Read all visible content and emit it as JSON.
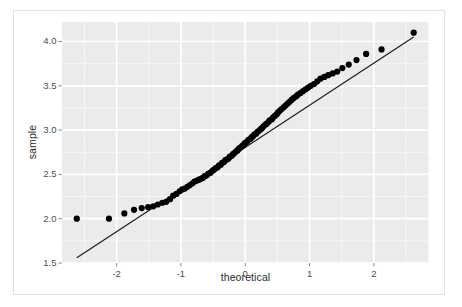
{
  "figure": {
    "background_color": "#ffffff",
    "border_color": "#e2e2e2",
    "panel_background_color": "#ebebeb",
    "gridline_major_color": "#ffffff",
    "gridline_minor_color": "#f7f7f7",
    "point_color": "#000000",
    "line_color": "#1a1a1a"
  },
  "chart_data": {
    "type": "scatter",
    "title": "",
    "subtitle": "",
    "xlabel": "theoretical",
    "ylabel": "sample",
    "xlim": [
      -2.85,
      2.85
    ],
    "ylim": [
      1.5,
      4.22
    ],
    "grid": true,
    "legend": "none",
    "x_ticks": [
      -2,
      -1,
      0,
      1,
      2
    ],
    "x_tick_labels": [
      "-2",
      "-1",
      "0",
      "1",
      "2"
    ],
    "y_ticks": [
      1.5,
      2.0,
      2.5,
      3.0,
      3.5,
      4.0
    ],
    "y_tick_labels": [
      "1.5",
      "2.0",
      "2.5",
      "3.0",
      "3.5",
      "4.0"
    ],
    "x_minor_ticks": [
      -2.5,
      -1.5,
      -0.5,
      0.5,
      1.5,
      2.5
    ],
    "y_minor_ticks": [
      1.75,
      2.25,
      2.75,
      3.25,
      3.75,
      4.25
    ],
    "reference_line": {
      "label": "qq-reference-line",
      "x_start": -2.62,
      "y_start": 1.56,
      "x_end": 2.62,
      "y_end": 4.05
    },
    "series": [
      {
        "name": "sample quantiles",
        "marker": "filled-circle",
        "marker_size": 3.1,
        "x": [
          -2.62,
          -2.12,
          -1.88,
          -1.73,
          -1.61,
          -1.51,
          -1.43,
          -1.36,
          -1.29,
          -1.23,
          -1.17,
          -1.12,
          -1.07,
          -1.02,
          -0.98,
          -0.94,
          -0.9,
          -0.86,
          -0.82,
          -0.79,
          -0.75,
          -0.72,
          -0.69,
          -0.66,
          -0.63,
          -0.6,
          -0.57,
          -0.54,
          -0.51,
          -0.49,
          -0.46,
          -0.43,
          -0.41,
          -0.38,
          -0.36,
          -0.33,
          -0.31,
          -0.28,
          -0.26,
          -0.24,
          -0.21,
          -0.19,
          -0.17,
          -0.14,
          -0.12,
          -0.1,
          -0.08,
          -0.05,
          -0.03,
          -0.01,
          0.01,
          0.03,
          0.05,
          0.08,
          0.1,
          0.12,
          0.14,
          0.17,
          0.19,
          0.21,
          0.24,
          0.26,
          0.28,
          0.31,
          0.33,
          0.36,
          0.38,
          0.41,
          0.43,
          0.46,
          0.49,
          0.51,
          0.54,
          0.57,
          0.6,
          0.63,
          0.66,
          0.69,
          0.72,
          0.75,
          0.79,
          0.82,
          0.86,
          0.9,
          0.94,
          0.98,
          1.02,
          1.07,
          1.12,
          1.17,
          1.23,
          1.29,
          1.36,
          1.43,
          1.51,
          1.61,
          1.73,
          1.88,
          2.12,
          2.62
        ],
        "y": [
          2.0,
          2.0,
          2.06,
          2.1,
          2.12,
          2.13,
          2.14,
          2.16,
          2.18,
          2.19,
          2.22,
          2.26,
          2.28,
          2.31,
          2.33,
          2.34,
          2.36,
          2.38,
          2.4,
          2.42,
          2.43,
          2.44,
          2.45,
          2.46,
          2.48,
          2.49,
          2.51,
          2.52,
          2.54,
          2.55,
          2.57,
          2.58,
          2.6,
          2.61,
          2.63,
          2.64,
          2.66,
          2.67,
          2.68,
          2.7,
          2.71,
          2.73,
          2.74,
          2.76,
          2.77,
          2.79,
          2.8,
          2.82,
          2.83,
          2.85,
          2.86,
          2.87,
          2.89,
          2.9,
          2.92,
          2.93,
          2.95,
          2.96,
          2.98,
          2.99,
          3.01,
          3.02,
          3.04,
          3.06,
          3.07,
          3.09,
          3.11,
          3.12,
          3.14,
          3.16,
          3.18,
          3.2,
          3.22,
          3.24,
          3.26,
          3.28,
          3.3,
          3.32,
          3.34,
          3.36,
          3.38,
          3.4,
          3.42,
          3.44,
          3.46,
          3.48,
          3.5,
          3.52,
          3.55,
          3.58,
          3.6,
          3.62,
          3.64,
          3.66,
          3.7,
          3.74,
          3.79,
          3.86,
          3.91,
          4.1
        ]
      }
    ]
  }
}
